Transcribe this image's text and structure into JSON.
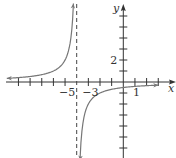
{
  "chart_data": {
    "type": "line",
    "title": "",
    "function": "y = -2/(x + 4)",
    "xlabel": "x",
    "ylabel": "y",
    "xlim": [
      -9.5,
      4.5
    ],
    "ylim": [
      -7,
      7
    ],
    "x_ticks": [
      -9,
      -8,
      -7,
      -6,
      -5,
      -4,
      -3,
      -2,
      -1,
      1,
      2,
      3
    ],
    "y_ticks": [
      -6,
      -5,
      -4,
      -3,
      -2,
      -1,
      1,
      2,
      3,
      4,
      5,
      6
    ],
    "tick_labels": [
      {
        "axis": "x",
        "value": -5,
        "text": "−5"
      },
      {
        "axis": "x",
        "value": -3,
        "text": "−3"
      },
      {
        "axis": "x",
        "value": 1,
        "text": "1"
      },
      {
        "axis": "y",
        "value": 2,
        "text": "2"
      }
    ],
    "asymptotes": {
      "vertical": -4,
      "horizontal": 0
    },
    "series": [
      {
        "name": "left-branch",
        "x_range": [
          -10,
          -4.28
        ]
      },
      {
        "name": "right-branch",
        "x_range": [
          -3.72,
          3
        ]
      }
    ],
    "grid": false,
    "colors": {
      "curve": "#777777",
      "axis": "#333333",
      "asymptote": "#444444"
    }
  }
}
